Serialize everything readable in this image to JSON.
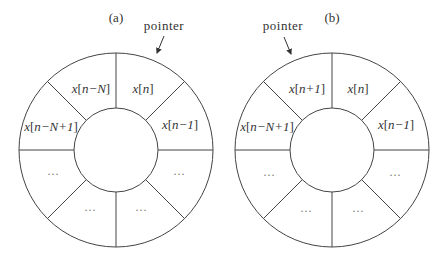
{
  "diagram_a": {
    "label": "(a)",
    "pointer_label": "pointer",
    "cells": {
      "top_left": {
        "var": "x",
        "open": "[",
        "idx": "n−N",
        "close": "]"
      },
      "top_right": {
        "var": "x",
        "open": "[",
        "idx": "n",
        "close": "]"
      },
      "upper_left": {
        "var": "x",
        "open": "[",
        "idx": "n−N+1",
        "close": "]"
      },
      "upper_right": {
        "var": "x",
        "open": "[",
        "idx": "n−1",
        "close": "]"
      },
      "lower_left": "···",
      "bottom_left": "···",
      "bottom_right": "···",
      "lower_right": "···"
    }
  },
  "diagram_b": {
    "label": "(b)",
    "pointer_label": "pointer",
    "cells": {
      "top_left": {
        "var": "x",
        "open": "[",
        "idx": "n+1",
        "close": "]"
      },
      "top_right": {
        "var": "x",
        "open": "[",
        "idx": "n",
        "close": "]"
      },
      "upper_left": {
        "var": "x",
        "open": "[",
        "idx": "n−N+1",
        "close": "]"
      },
      "upper_right": {
        "var": "x",
        "open": "[",
        "idx": "n−1",
        "close": "]"
      },
      "lower_left": "···",
      "bottom_left": "···",
      "bottom_right": "···",
      "lower_right": "···"
    }
  },
  "colors": {
    "line": "#444444",
    "text": "#333333",
    "dots": "#777777",
    "background": "#ffffff"
  }
}
